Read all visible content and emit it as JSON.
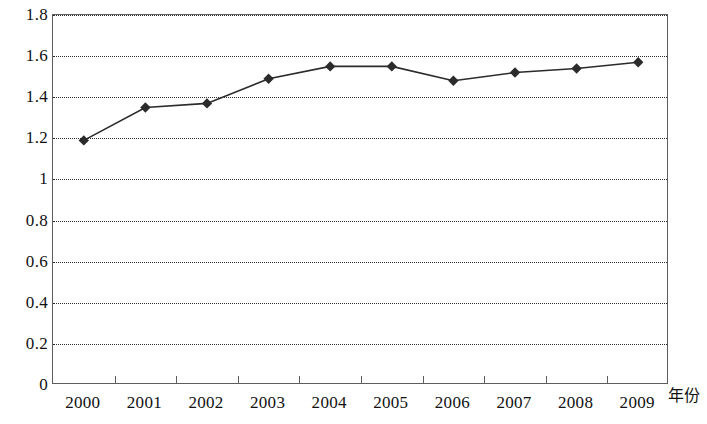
{
  "chart_data": {
    "type": "line",
    "title": "",
    "subtitle": "",
    "xlabel": "年份",
    "ylabel": "",
    "categories": [
      "2000",
      "2001",
      "2002",
      "2003",
      "2004",
      "2005",
      "2006",
      "2007",
      "2008",
      "2009"
    ],
    "values": [
      1.19,
      1.35,
      1.37,
      1.49,
      1.55,
      1.55,
      1.48,
      1.52,
      1.54,
      1.57
    ],
    "series": [
      {
        "name": "",
        "values": [
          1.19,
          1.35,
          1.37,
          1.49,
          1.55,
          1.55,
          1.48,
          1.52,
          1.54,
          1.57
        ]
      }
    ],
    "ylim": [
      0,
      1.8
    ],
    "y_ticks": [
      0,
      0.2,
      0.4,
      0.6,
      0.8,
      1,
      1.2,
      1.4,
      1.6,
      1.8
    ],
    "y_tick_labels": [
      "0",
      "0.2",
      "0.4",
      "0.6",
      "0.8",
      "1",
      "1.2",
      "1.4",
      "1.6",
      "1.8"
    ],
    "grid": "horizontal-dotted",
    "legend": "none",
    "marker": "diamond",
    "line_color": "#2b2b2b",
    "marker_color": "#2b2b2b",
    "grid_color": "#2b2b2b",
    "axis_color": "#5d5d5d",
    "background_color": "#ffffff"
  }
}
